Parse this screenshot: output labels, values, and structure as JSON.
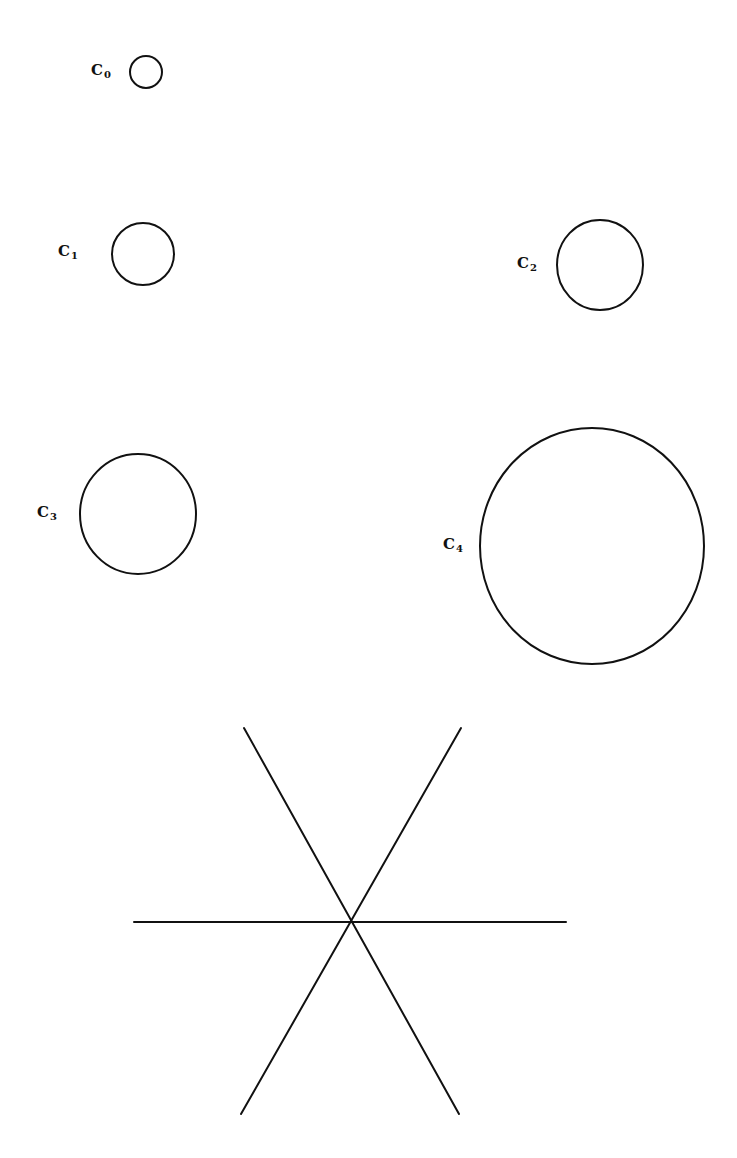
{
  "figure": {
    "stroke_color": "#111111",
    "background": "#ffffff",
    "circles": [
      {
        "label": "C",
        "subscript": "0",
        "cx": 146,
        "cy": 72,
        "rx": 16,
        "ry": 16,
        "label_x": 91,
        "label_y": 63
      },
      {
        "label": "C",
        "subscript": "1",
        "cx": 143,
        "cy": 254,
        "rx": 31,
        "ry": 31,
        "label_x": 58,
        "label_y": 244
      },
      {
        "label": "C",
        "subscript": "2",
        "cx": 600,
        "cy": 265,
        "rx": 43,
        "ry": 45,
        "label_x": 517,
        "label_y": 256
      },
      {
        "label": "C",
        "subscript": "3",
        "cx": 138,
        "cy": 514,
        "rx": 58,
        "ry": 60,
        "label_x": 37,
        "label_y": 505
      },
      {
        "label": "C",
        "subscript": "4",
        "cx": 592,
        "cy": 546,
        "rx": 112,
        "ry": 118,
        "label_x": 443,
        "label_y": 537
      }
    ],
    "star": {
      "center": {
        "x": 350,
        "y": 922
      },
      "lines": [
        {
          "name": "horizontal-line",
          "x1": 134,
          "y1": 922,
          "x2": 566,
          "y2": 922
        },
        {
          "name": "diagonal-line-descending",
          "x1": 244,
          "y1": 728,
          "x2": 459,
          "y2": 1114
        },
        {
          "name": "diagonal-line-ascending",
          "x1": 461,
          "y1": 728,
          "x2": 241,
          "y2": 1114
        }
      ]
    }
  },
  "caption": {
    "text": ""
  }
}
